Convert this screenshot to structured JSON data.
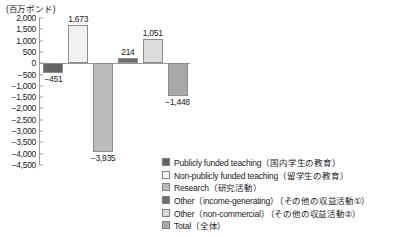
{
  "chart_data": {
    "type": "bar",
    "title": "",
    "subtitle": "",
    "xlabel": "",
    "ylabel": "(百万ポンド)",
    "ylim": [
      -4500,
      2000
    ],
    "y_tick_step": 500,
    "grid": false,
    "legend_position": "bottom-right",
    "categories": [
      "Publicly funded teaching",
      "Non-publicly funded teaching",
      "Research",
      "Other (income-generating)",
      "Other (non-commercial)",
      "Total"
    ],
    "values": [
      -451,
      1673,
      -3935,
      214,
      1051,
      -1448
    ],
    "value_labels": [
      "−451",
      "1,673",
      "−3,935",
      "214",
      "1,051",
      "−1,448"
    ],
    "colors": [
      "#646464",
      "#f2f2f2",
      "#bcbcbc",
      "#707070",
      "#dcdcdc",
      "#a8a8a8"
    ],
    "y_tick_labels": [
      "2,000",
      "1,500",
      "1,000",
      "500",
      "0",
      "−500",
      "−1,000",
      "−1,500",
      "−2,000",
      "−2,500",
      "−3,000",
      "−3,500",
      "−4,000",
      "−4,500"
    ],
    "y_tick_values": [
      2000,
      1500,
      1000,
      500,
      0,
      -500,
      -1000,
      -1500,
      -2000,
      -2500,
      -3000,
      -3500,
      -4000,
      -4500
    ]
  },
  "legend": {
    "items": [
      {
        "label": "Publicly funded teaching（国内学生の教育）",
        "color": "#646464"
      },
      {
        "label": "Non-publicly funded teaching（留学生の教育）",
        "color": "#f7f7f7"
      },
      {
        "label": "Research（研究活動）",
        "color": "#bcbcbc"
      },
      {
        "label": "Other（income-generating）（その他の収益活動①）",
        "color": "#707070"
      },
      {
        "label": "Other（non-commercial）（その他の収益活動②）",
        "color": "#dcdcdc"
      },
      {
        "label": "Total（全体）",
        "color": "#a8a8a8"
      }
    ]
  },
  "axis": {
    "unit_caption": "(百万ポンド)"
  }
}
